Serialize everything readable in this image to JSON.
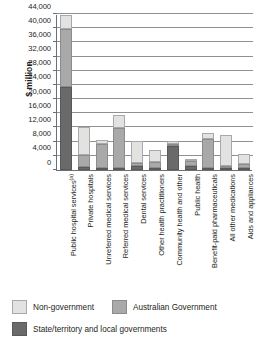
{
  "chart_data": {
    "type": "bar",
    "subtype": "stacked-vertical",
    "title": "",
    "xlabel": "",
    "ylabel": "$ million",
    "ylim": [
      0,
      44000
    ],
    "ytick_step": 4000,
    "yticks": [
      "0",
      "4,000",
      "8,000",
      "12,000",
      "16,000",
      "20,000",
      "24,000",
      "28,000",
      "32,000",
      "36,000",
      "40,000",
      "44,000"
    ],
    "grid": "horizontal",
    "legend_position": "bottom-left",
    "categories": [
      "Public hospital services",
      "Private hospitals",
      "Unreferred medical services",
      "Referred medical services",
      "Dental services",
      "Other health practitioners",
      "Community health and other",
      "Public health",
      "Benefit-paid pharmaceuticals",
      "All other medications",
      "Aids and appliances"
    ],
    "category_footnotes": [
      "(a)",
      "",
      "",
      "",
      "",
      "",
      "",
      "",
      "",
      "",
      ""
    ],
    "series": [
      {
        "name": "State/territory and local governments",
        "color": "#6a6a6a",
        "values": [
          23500,
          900,
          400,
          300,
          1100,
          300,
          6700,
          1000,
          100,
          300,
          100
        ]
      },
      {
        "name": "Australian Government",
        "color": "#a9a9a9",
        "values": [
          16400,
          3300,
          6800,
          11200,
          800,
          1600,
          700,
          1600,
          8300,
          500,
          1100
        ]
      },
      {
        "name": "Non-government",
        "color": "#e2e2e0",
        "values": [
          3800,
          7800,
          1100,
          3700,
          6300,
          3600,
          700,
          100,
          1600,
          8700,
          2900
        ]
      }
    ],
    "totals": [
      43700,
      12000,
      8300,
      15200,
      8200,
      5500,
      8100,
      2700,
      10000,
      9500,
      4100
    ]
  },
  "axis": {
    "ylabel": "$ million"
  },
  "legend": {
    "items": [
      {
        "label": "Non-government",
        "swatch": "nongov"
      },
      {
        "label": "Australian Government",
        "swatch": "aus"
      },
      {
        "label": "State/territory and local governments",
        "swatch": "state"
      }
    ]
  }
}
